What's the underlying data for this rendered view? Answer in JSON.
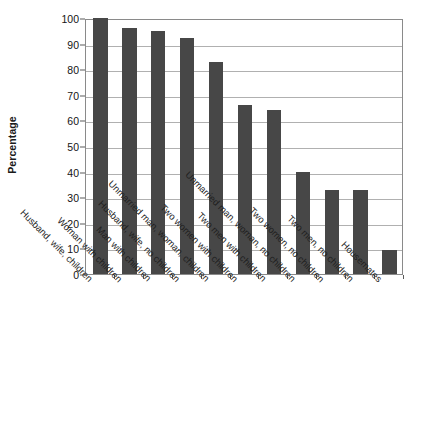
{
  "chart_data": {
    "type": "bar",
    "title": "",
    "xlabel": "",
    "ylabel": "Percentage",
    "ylim": [
      0,
      100
    ],
    "yticks": [
      0,
      10,
      20,
      30,
      40,
      50,
      60,
      70,
      80,
      90,
      100
    ],
    "ytick_labels": [
      "0",
      "10",
      "20",
      "30",
      "40",
      "50",
      "60",
      "70",
      "80",
      "90",
      "100"
    ],
    "grid": true,
    "legend": "none",
    "bar_color": "#474747",
    "categories": [
      "Husband, wife, children",
      "Woman with children",
      "Man with children",
      "Husband, wife, no children",
      "Unmarried man, woman, children",
      "Two women with children",
      "Two men with children",
      "Unmarried man, woman, no children",
      "Two women, no children",
      "Two men, no children",
      "Housemates"
    ],
    "values": [
      100,
      96,
      95,
      92,
      83,
      66,
      64,
      40,
      33,
      33,
      9.5
    ]
  },
  "axes": {
    "y_title": "Percentage"
  }
}
